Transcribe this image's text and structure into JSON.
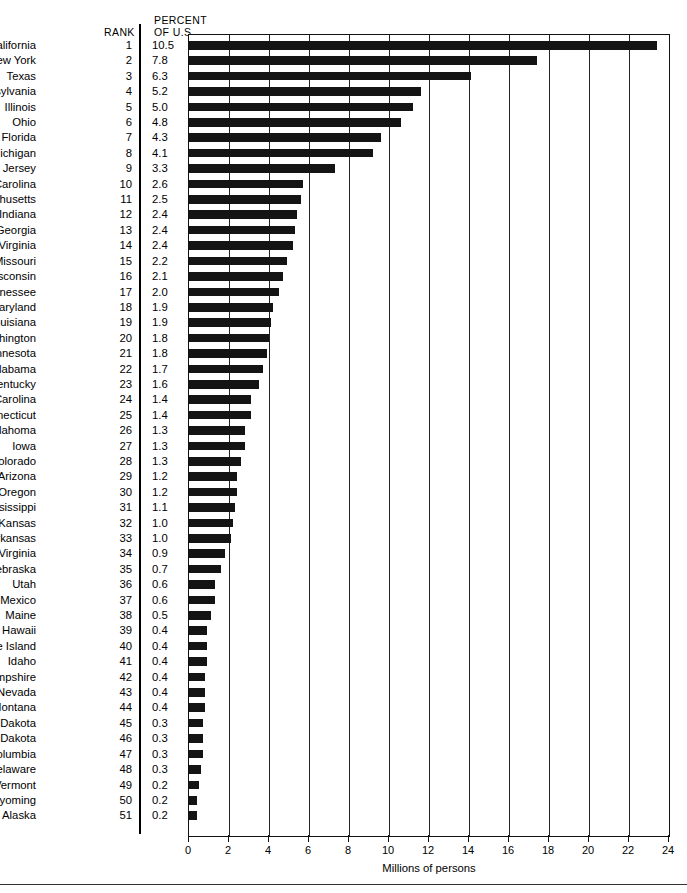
{
  "header": {
    "rank_label": "RANK",
    "percent_label": "PERCENT",
    "of_us_label": "OF U.S."
  },
  "axis": {
    "title": "Millions of persons",
    "ticks": [
      "0",
      "2",
      "4",
      "6",
      "8",
      "10",
      "12",
      "14",
      "16",
      "18",
      "20",
      "22",
      "24"
    ]
  },
  "chart_data": {
    "type": "bar",
    "orientation": "horizontal",
    "title": "",
    "xlabel": "Millions of persons",
    "ylabel": "",
    "xlim": [
      0,
      24
    ],
    "xticks": [
      0,
      2,
      4,
      6,
      8,
      10,
      12,
      14,
      16,
      18,
      20,
      22,
      24
    ],
    "grid": true,
    "legend": "none",
    "columns": [
      "State",
      "Rank",
      "Percent of U.S.",
      "Millions of persons"
    ],
    "categories": [
      "California",
      "New York",
      "Texas",
      "Pennsylvania",
      "Illinois",
      "Ohio",
      "Florida",
      "Michigan",
      "New Jersey",
      "North Carolina",
      "Massachusetts",
      "Indiana",
      "Georgia",
      "Virginia",
      "Missouri",
      "Wisconsin",
      "Tennessee",
      "Maryland",
      "Louisiana",
      "Washington",
      "Minnesota",
      "Alabama",
      "Kentucky",
      "South Carolina",
      "Connecticut",
      "Oklahoma",
      "Iowa",
      "Colorado",
      "Arizona",
      "Oregon",
      "Mississippi",
      "Kansas",
      "Arkansas",
      "West Virginia",
      "Nebraska",
      "Utah",
      "New Mexico",
      "Maine",
      "Hawaii",
      "Rhode Island",
      "Idaho",
      "New Hampshire",
      "Nevada",
      "Montana",
      "South Dakota",
      "North Dakota",
      "District of Columbia",
      "Delaware",
      "Vermont",
      "Wyoming",
      "Alaska"
    ],
    "ranks": [
      1,
      2,
      3,
      4,
      5,
      6,
      7,
      8,
      9,
      10,
      11,
      12,
      13,
      14,
      15,
      16,
      17,
      18,
      19,
      20,
      21,
      22,
      23,
      24,
      25,
      26,
      27,
      28,
      29,
      30,
      31,
      32,
      33,
      34,
      35,
      36,
      37,
      38,
      39,
      40,
      41,
      42,
      43,
      44,
      45,
      46,
      47,
      48,
      49,
      50,
      51
    ],
    "percent_of_us": [
      "10.5",
      "7.8",
      "6.3",
      "5.2",
      "5.0",
      "4.8",
      "4.3",
      "4.1",
      "3.3",
      "2.6",
      "2.5",
      "2.4",
      "2.4",
      "2.4",
      "2.2",
      "2.1",
      "2.0",
      "1.9",
      "1.9",
      "1.8",
      "1.8",
      "1.7",
      "1.6",
      "1.4",
      "1.4",
      "1.3",
      "1.3",
      "1.3",
      "1.2",
      "1.2",
      "1.1",
      "1.0",
      "1.0",
      "0.9",
      "0.7",
      "0.6",
      "0.6",
      "0.5",
      "0.4",
      "0.4",
      "0.4",
      "0.4",
      "0.4",
      "0.4",
      "0.3",
      "0.3",
      "0.3",
      "0.3",
      "0.2",
      "0.2",
      "0.2"
    ],
    "values": [
      23.4,
      17.4,
      14.1,
      11.6,
      11.2,
      10.6,
      9.6,
      9.2,
      7.3,
      5.7,
      5.6,
      5.4,
      5.3,
      5.2,
      4.9,
      4.7,
      4.5,
      4.2,
      4.1,
      4.0,
      3.9,
      3.7,
      3.5,
      3.1,
      3.1,
      2.8,
      2.8,
      2.6,
      2.4,
      2.4,
      2.3,
      2.2,
      2.1,
      1.8,
      1.6,
      1.3,
      1.3,
      1.1,
      0.9,
      0.9,
      0.9,
      0.8,
      0.8,
      0.8,
      0.7,
      0.7,
      0.7,
      0.6,
      0.5,
      0.4,
      0.4
    ]
  }
}
